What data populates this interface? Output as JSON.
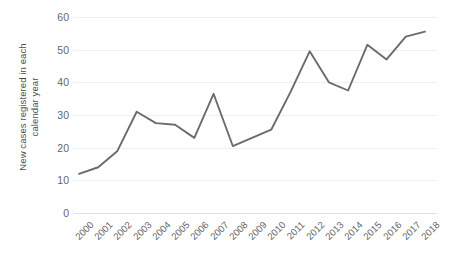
{
  "chart_data": {
    "type": "line",
    "title": "",
    "xlabel": "",
    "ylabel": "New cases registered in each\ncalendar year",
    "ylim": [
      0,
      60
    ],
    "ytick_values": [
      0,
      10,
      20,
      30,
      40,
      50,
      60
    ],
    "ytick_labels": [
      "0",
      "10",
      "20",
      "30",
      "40",
      "50",
      "60"
    ],
    "grid": true,
    "legend": false,
    "legend_position": "none",
    "line_color": "#6b6b6b",
    "grid_color": "#efefef",
    "categories": [
      "2000",
      "2001",
      "2002",
      "2003",
      "2004",
      "2005",
      "2006",
      "2007",
      "2008",
      "2009",
      "2010",
      "2011",
      "2012",
      "2013",
      "2014",
      "2015",
      "2016",
      "2017",
      "2018"
    ],
    "values": [
      12,
      14,
      19,
      31,
      27.5,
      27,
      23,
      36.5,
      20.5,
      23,
      25.5,
      37,
      49.5,
      40,
      37.5,
      51.5,
      47,
      54,
      55.5
    ],
    "series": [
      {
        "name": "New cases registered in each calendar year",
        "values": [
          12,
          14,
          19,
          31,
          27.5,
          27,
          23,
          36.5,
          20.5,
          23,
          25.5,
          37,
          49.5,
          40,
          37.5,
          51.5,
          47,
          54,
          55.5
        ]
      }
    ]
  },
  "geometry": {
    "plot_left": 79,
    "plot_right": 425,
    "plot_top": 17,
    "plot_bottom": 213
  }
}
